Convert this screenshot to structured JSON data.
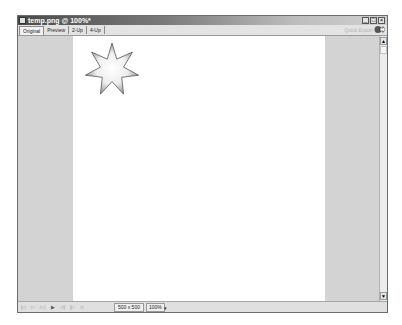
{
  "window": {
    "title": "temp.png @ 100%*",
    "controls": {
      "minimize": "_",
      "maximize": "□",
      "close": "×"
    }
  },
  "toolbar": {
    "tabs": [
      {
        "label": "Original",
        "active": true
      },
      {
        "label": "Preview",
        "active": false
      },
      {
        "label": "2-Up",
        "active": false
      },
      {
        "label": "4-Up",
        "active": false
      }
    ],
    "quick_export_label": "Quick Export",
    "export_icon": "quick-export-icon"
  },
  "canvas": {
    "background": "#ffffff",
    "shape": "7-point star with radial gradient"
  },
  "scrollbar": {
    "up": "▲",
    "down": "▼"
  },
  "statusbar": {
    "controls": [
      "|◁",
      "▷",
      "▷|",
      "▶",
      "◁|",
      "|▷",
      "◇"
    ],
    "dimensions": "500 x 500",
    "zoom": "100%",
    "zoom_dropdown": "▾"
  },
  "colors": {
    "title_gradient_start": "#4a4a4a",
    "panel": "#d3d3d3",
    "toolbar": "#e3e3e3"
  }
}
